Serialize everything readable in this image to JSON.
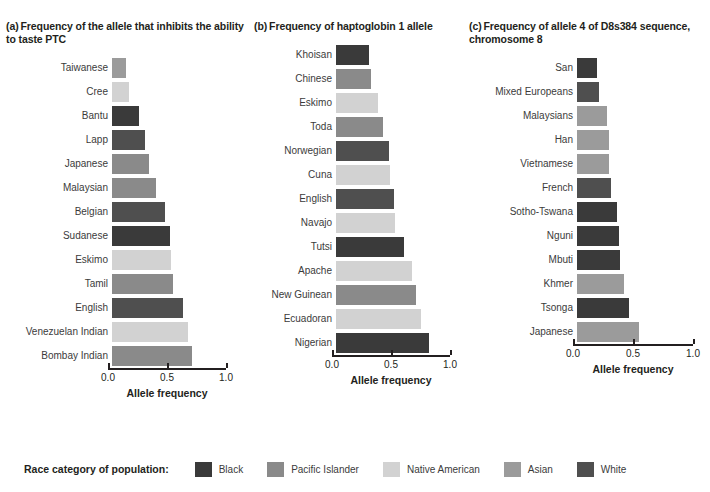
{
  "legend": {
    "title": "Race category of population:",
    "items": [
      {
        "label": "Black",
        "color": "#3a3a3a"
      },
      {
        "label": "Pacific Islander",
        "color": "#8a8a8a"
      },
      {
        "label": "Native American",
        "color": "#d2d2d2"
      },
      {
        "label": "Asian",
        "color": "#9b9b9b"
      },
      {
        "label": "White",
        "color": "#4f4f4f"
      }
    ]
  },
  "colors": {
    "Black": "#3a3a3a",
    "Pacific Islander": "#8a8a8a",
    "Native American": "#d2d2d2",
    "Asian": "#9b9b9b",
    "White": "#4f4f4f",
    "axis": "#231f20",
    "text": "#3b3b3b"
  },
  "chart_data": [
    {
      "type": "bar",
      "orientation": "horizontal",
      "panel": "a",
      "panel_label": "(a)",
      "title": "Frequency of the allele that inhibits the ability to taste PTC",
      "xlabel": "Allele frequency",
      "ylabel": "",
      "xlim": [
        0.0,
        1.0
      ],
      "xticks": [
        0.0,
        0.5,
        1.0
      ],
      "xticklabels": [
        "0.0",
        "0.5",
        "1.0"
      ],
      "grid": false,
      "categories": [
        "Taiwanese",
        "Cree",
        "Bantu",
        "Lapp",
        "Japanese",
        "Malaysian",
        "Belgian",
        "Sudanese",
        "Eskimo",
        "Tamil",
        "English",
        "Venezuelan Indian",
        "Bombay Indian"
      ],
      "values": [
        0.12,
        0.14,
        0.23,
        0.28,
        0.31,
        0.37,
        0.45,
        0.49,
        0.5,
        0.52,
        0.6,
        0.64,
        0.68
      ],
      "races": [
        "Asian",
        "Native American",
        "Black",
        "White",
        "Pacific Islander",
        "Pacific Islander",
        "White",
        "Black",
        "Native American",
        "Pacific Islander",
        "White",
        "Native American",
        "Pacific Islander"
      ]
    },
    {
      "type": "bar",
      "orientation": "horizontal",
      "panel": "b",
      "panel_label": "(b)",
      "title": "Frequency of haptoglobin 1 allele",
      "xlabel": "Allele frequency",
      "ylabel": "",
      "xlim": [
        0.0,
        1.0
      ],
      "xticks": [
        0.0,
        0.5,
        1.0
      ],
      "xticklabels": [
        "0.0",
        "0.5",
        "1.0"
      ],
      "grid": false,
      "categories": [
        "Khoisan",
        "Chinese",
        "Eskimo",
        "Toda",
        "Norwegian",
        "Cuna",
        "English",
        "Navajo",
        "Tutsi",
        "Apache",
        "New Guinean",
        "Ecuadoran",
        "Nigerian"
      ],
      "values": [
        0.28,
        0.3,
        0.36,
        0.4,
        0.45,
        0.46,
        0.49,
        0.5,
        0.58,
        0.64,
        0.68,
        0.72,
        0.79
      ],
      "races": [
        "Black",
        "Pacific Islander",
        "Native American",
        "Pacific Islander",
        "White",
        "Native American",
        "White",
        "Native American",
        "Black",
        "Native American",
        "Pacific Islander",
        "Native American",
        "Black"
      ]
    },
    {
      "type": "bar",
      "orientation": "horizontal",
      "panel": "c",
      "panel_label": "(c)",
      "title": "Frequency of allele 4 of D8s384 sequence, chromosome 8",
      "xlabel": "Allele frequency",
      "ylabel": "",
      "xlim": [
        0.0,
        1.0
      ],
      "xticks": [
        0.0,
        0.5,
        1.0
      ],
      "xticklabels": [
        "0.0",
        "0.5",
        "1.0"
      ],
      "grid": false,
      "categories": [
        "San",
        "Mixed Europeans",
        "Malaysians",
        "Han",
        "Vietnamese",
        "French",
        "Sotho-Tswana",
        "Nguni",
        "Mbuti",
        "Khmer",
        "Tsonga",
        "Japanese"
      ],
      "values": [
        0.17,
        0.18,
        0.25,
        0.27,
        0.27,
        0.28,
        0.33,
        0.35,
        0.36,
        0.39,
        0.43,
        0.52
      ],
      "races": [
        "Black",
        "White",
        "Asian",
        "Asian",
        "Asian",
        "White",
        "Black",
        "Black",
        "Black",
        "Asian",
        "Black",
        "Asian"
      ]
    }
  ]
}
